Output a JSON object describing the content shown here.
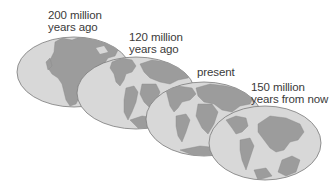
{
  "colors": {
    "background": "#ffffff",
    "ocean": "#d8d8d8",
    "land": "#9c9c9c",
    "outline": "#7a7a7a",
    "text": "#3a3a3a"
  },
  "globes": [
    {
      "id": "globe-200-mya",
      "label_line1": "200 million",
      "label_line2": "years ago",
      "map": "pangaea"
    },
    {
      "id": "globe-120-mya",
      "label_line1": "120 million",
      "label_line2": "years ago",
      "map": "early-breakup"
    },
    {
      "id": "globe-present",
      "label_line1": "present",
      "label_line2": "",
      "map": "present-day"
    },
    {
      "id": "globe-150-my-future",
      "label_line1": "150 million",
      "label_line2": "years from now",
      "map": "future-supercontinent"
    }
  ]
}
